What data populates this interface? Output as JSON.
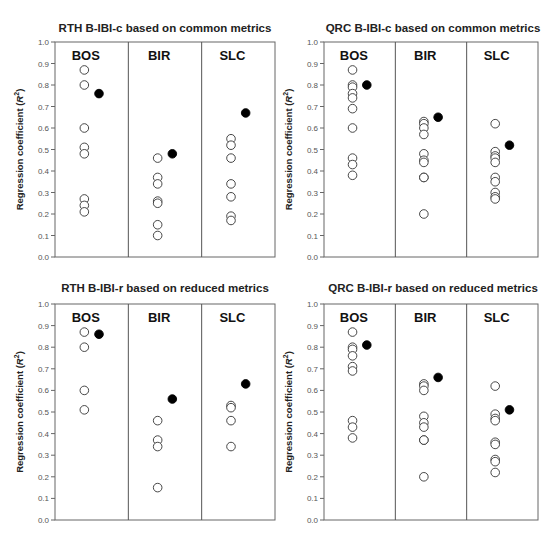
{
  "chart_data": [
    {
      "type": "scatter",
      "title": "RTH B-IBI-c based on common metrics",
      "ylabel": "Regression coefficient (R²)",
      "ylim": [
        0.0,
        1.0
      ],
      "yticks": [
        "0.0",
        "0.1",
        "0.2",
        "0.3",
        "0.4",
        "0.5",
        "0.6",
        "0.7",
        "0.8",
        "0.9",
        "1.0"
      ],
      "groups": [
        {
          "name": "BOS",
          "open": [
            0.87,
            0.8,
            0.6,
            0.51,
            0.48,
            0.27,
            0.24,
            0.21
          ],
          "filled": 0.76
        },
        {
          "name": "BIR",
          "open": [
            0.46,
            0.37,
            0.34,
            0.26,
            0.25,
            0.15,
            0.1
          ],
          "filled": 0.48
        },
        {
          "name": "SLC",
          "open": [
            0.55,
            0.52,
            0.46,
            0.34,
            0.28,
            0.19,
            0.17
          ],
          "filled": 0.67
        }
      ],
      "legend": "open circles = individual metrics/indices; filled circle = B-IBI"
    },
    {
      "type": "scatter",
      "title": "QRC B-IBI-c based on common metrics",
      "ylabel": "Regression coefficient (R²)",
      "ylim": [
        0.0,
        1.0
      ],
      "yticks": [
        "0.0",
        "0.1",
        "0.2",
        "0.3",
        "0.4",
        "0.5",
        "0.6",
        "0.7",
        "0.8",
        "0.9",
        "1.0"
      ],
      "groups": [
        {
          "name": "BOS",
          "open": [
            0.87,
            0.8,
            0.79,
            0.76,
            0.74,
            0.69,
            0.6,
            0.46,
            0.43,
            0.38
          ],
          "filled": 0.8
        },
        {
          "name": "BIR",
          "open": [
            0.63,
            0.62,
            0.6,
            0.57,
            0.48,
            0.45,
            0.44,
            0.37,
            0.37,
            0.2
          ],
          "filled": 0.65
        },
        {
          "name": "SLC",
          "open": [
            0.62,
            0.49,
            0.47,
            0.46,
            0.44,
            0.37,
            0.35,
            0.3,
            0.28,
            0.27
          ],
          "filled": 0.52
        }
      ]
    },
    {
      "type": "scatter",
      "title": "RTH B-IBI-r based on reduced metrics",
      "ylabel": "Regression coefficient (R²)",
      "ylim": [
        0.0,
        1.0
      ],
      "yticks": [
        "0.0",
        "0.1",
        "0.2",
        "0.3",
        "0.4",
        "0.5",
        "0.6",
        "0.7",
        "0.8",
        "0.9",
        "1.0"
      ],
      "groups": [
        {
          "name": "BOS",
          "open": [
            0.87,
            0.8,
            0.6,
            0.51
          ],
          "filled": 0.86
        },
        {
          "name": "BIR",
          "open": [
            0.46,
            0.37,
            0.34,
            0.15
          ],
          "filled": 0.56
        },
        {
          "name": "SLC",
          "open": [
            0.53,
            0.52,
            0.46,
            0.34
          ],
          "filled": 0.63
        }
      ]
    },
    {
      "type": "scatter",
      "title": "QRC B-IBI-r based on reduced metrics",
      "ylabel": "Regression coefficient (R²)",
      "ylim": [
        0.0,
        1.0
      ],
      "yticks": [
        "0.0",
        "0.1",
        "0.2",
        "0.3",
        "0.4",
        "0.5",
        "0.6",
        "0.7",
        "0.8",
        "0.9",
        "1.0"
      ],
      "groups": [
        {
          "name": "BOS",
          "open": [
            0.87,
            0.8,
            0.79,
            0.76,
            0.71,
            0.69,
            0.46,
            0.43,
            0.38
          ],
          "filled": 0.81
        },
        {
          "name": "BIR",
          "open": [
            0.63,
            0.62,
            0.6,
            0.48,
            0.45,
            0.43,
            0.37,
            0.37,
            0.2
          ],
          "filled": 0.66
        },
        {
          "name": "SLC",
          "open": [
            0.62,
            0.49,
            0.47,
            0.46,
            0.36,
            0.35,
            0.28,
            0.27,
            0.22
          ],
          "filled": 0.51
        }
      ]
    }
  ],
  "ylabel_main": "Regression coefficient (",
  "ylabel_r": "R",
  "ylabel_sup": "2",
  "ylabel_close": ")"
}
